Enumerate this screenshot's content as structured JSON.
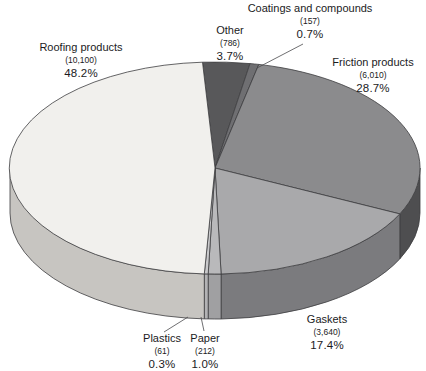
{
  "chart_data": {
    "type": "pie",
    "style": "3d-elliptical",
    "title": "",
    "legend": "none",
    "label_style": "external labels: name, (value), percent",
    "outline_color": "#3e3e40",
    "leader_line_color": "#4a4a4c",
    "background": "#ffffff",
    "slices": [
      {
        "label": "Other",
        "value": 786,
        "value_label": "(786)",
        "pct": 3.7,
        "pct_label": "3.7%",
        "color_top": "#58585a",
        "color_side": "#3f3f41"
      },
      {
        "label": "Coatings and compounds",
        "value": 157,
        "value_label": "(157)",
        "pct": 0.7,
        "pct_label": "0.7%",
        "color_top": "#6f6f72",
        "color_side": "#505052"
      },
      {
        "label": "Friction products",
        "value": 6010,
        "value_label": "(6,010)",
        "pct": 28.7,
        "pct_label": "28.7%",
        "color_top": "#8b8b8d",
        "color_side": "#4e4e50"
      },
      {
        "label": "Gaskets",
        "value": 3640,
        "value_label": "(3,640)",
        "pct": 17.4,
        "pct_label": "17.4%",
        "color_top": "#a9a9ab",
        "color_side": "#7b7b7e"
      },
      {
        "label": "Paper",
        "value": 212,
        "value_label": "(212)",
        "pct": 1.0,
        "pct_label": "1.0%",
        "color_top": "#b9b9bb",
        "color_side": "#a0a0a2"
      },
      {
        "label": "Plastics",
        "value": 61,
        "value_label": "(61)",
        "pct": 0.3,
        "pct_label": "0.3%",
        "color_top": "#c9c9cb",
        "color_side": "#b3b3b5"
      },
      {
        "label": "Roofing products",
        "value": 10100,
        "value_label": "(10,100)",
        "pct": 48.2,
        "pct_label": "48.2%",
        "color_top": "#f1f0ed",
        "color_side": "#c7c5c1"
      }
    ]
  }
}
